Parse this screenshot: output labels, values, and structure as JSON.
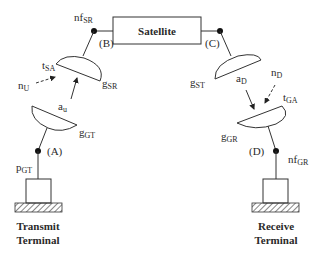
{
  "diagram": {
    "satellite": {
      "label": "Satellite"
    },
    "nodes": {
      "A": {
        "label": "(A)"
      },
      "B": {
        "label": "(B)"
      },
      "C": {
        "label": "(C)"
      },
      "D": {
        "label": "(D)"
      }
    },
    "labels": {
      "nf_SR": {
        "main": "nf",
        "sub": "SR"
      },
      "nf_GR": {
        "main": "nf",
        "sub": "GR"
      },
      "t_SA": {
        "main": "t",
        "sub": "SA"
      },
      "t_GA": {
        "main": "t",
        "sub": "GA"
      },
      "g_SR": {
        "main": "g",
        "sub": "SR"
      },
      "g_ST": {
        "main": "g",
        "sub": "ST"
      },
      "g_GT": {
        "main": "g",
        "sub": "GT"
      },
      "g_GR": {
        "main": "g",
        "sub": "GR"
      },
      "n_U": {
        "main": "n",
        "sub": "U"
      },
      "n_D": {
        "main": "n",
        "sub": "D"
      },
      "a_u": {
        "main": "a",
        "sub": "u"
      },
      "a_D": {
        "main": "a",
        "sub": "D"
      },
      "p_GT": {
        "main": "p",
        "sub": "GT"
      }
    },
    "terminals": {
      "transmit": {
        "line1": "Transmit",
        "line2": "Terminal"
      },
      "receive": {
        "line1": "Receive",
        "line2": "Terminal"
      }
    }
  }
}
